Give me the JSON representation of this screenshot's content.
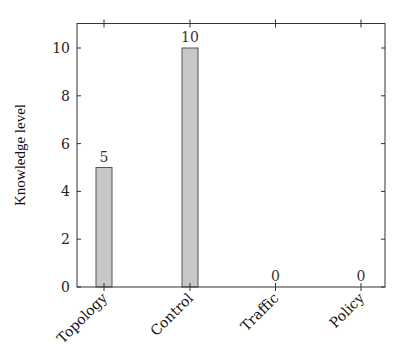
{
  "chart_data": {
    "type": "bar",
    "title": "",
    "xlabel": "",
    "ylabel": "Knowledge level",
    "categories": [
      "Topology",
      "Control",
      "Traffic",
      "Policy"
    ],
    "values": [
      5,
      10,
      0,
      0
    ],
    "value_labels": [
      "5",
      "10",
      "0",
      "0"
    ],
    "ylim": [
      0,
      11
    ],
    "yticks": [
      0,
      2,
      4,
      6,
      8,
      10
    ],
    "ytick_labels": [
      "0",
      "2",
      "4",
      "6",
      "8",
      "10"
    ],
    "grid": false,
    "legend": null,
    "bar_fill": "#c8c8c8",
    "bar_stroke": "#555555",
    "axis_color": "#333333"
  }
}
